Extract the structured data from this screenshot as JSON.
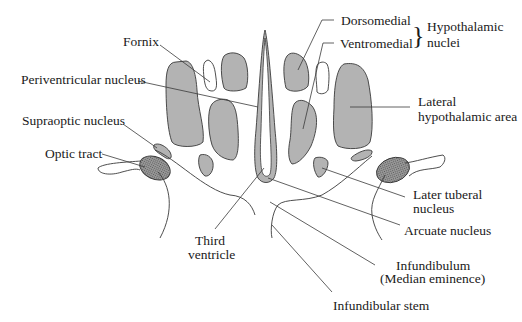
{
  "diagram": {
    "type": "anatomical-cross-section",
    "colors": {
      "nucleus_fill": "#b3b3b3",
      "outline": "#3a3a3a",
      "background": "#ffffff",
      "text": "#1a1a1a"
    },
    "labels": {
      "fornix": "Fornix",
      "periventricular": "Periventricular nucleus",
      "supraoptic": "Supraoptic nucleus",
      "optic_tract": "Optic tract",
      "third_ventricle_1": "Third",
      "third_ventricle_2": "ventricle",
      "dorsomedial": "Dorsomedial",
      "ventromedial": "Ventromedial",
      "hypothalamic_1": "Hypothalamic",
      "hypothalamic_2": "nuclei",
      "lateral_1": "Lateral",
      "lateral_2": "hypothalamic area",
      "later_tuberal_1": "Later tuberal",
      "later_tuberal_2": "nucleus",
      "arcuate": "Arcuate nucleus",
      "infundibulum_1": "Infundibulum",
      "infundibulum_2": "(Median eminence)",
      "infundibular_stem": "Infundibular stem"
    },
    "brace": "}"
  }
}
